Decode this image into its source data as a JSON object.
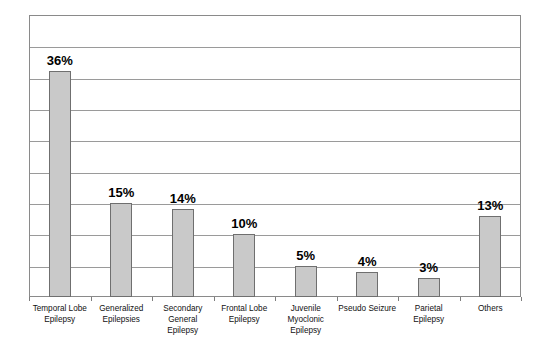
{
  "chart_data": {
    "type": "bar",
    "title": "",
    "subtitle": "",
    "xlabel": "",
    "ylabel": "",
    "ylim": [
      0,
      45
    ],
    "grid": true,
    "gridline_values": [
      5,
      10,
      15,
      20,
      25,
      30,
      35,
      40
    ],
    "legend": "none",
    "categories": [
      "Temporal Lobe\nEpilepsy",
      "Generalized\nEpilepsies",
      "Secondary\nGeneral\nEpilepsy",
      "Frontal Lobe\nEpilepsy",
      "Juvenile\nMyoclonic\nEpilepsy",
      "Pseudo Seizure",
      "Parietal\nEpilepsy",
      "Others"
    ],
    "values": [
      36,
      15,
      14,
      10,
      5,
      4,
      3,
      13
    ],
    "data_labels": [
      "36%",
      "15%",
      "14%",
      "10%",
      "5%",
      "4%",
      "3%",
      "13%"
    ],
    "bar_color": "#c9c9c9",
    "bar_border_color": "#6f6f6f",
    "gridline_color": "#9a9a9a",
    "frame_color": "#8a8a8a",
    "background": "#ffffff"
  }
}
